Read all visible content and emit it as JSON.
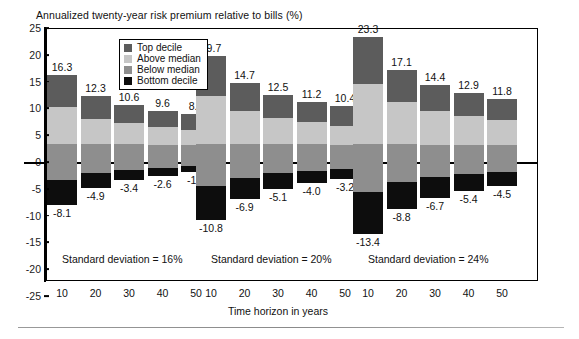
{
  "chart_data": {
    "type": "bar",
    "title": "Annualized twenty-year risk premium relative to bills (%)",
    "xlabel": "Time horizon in years",
    "ylabel": "",
    "ylim": [
      -25,
      25
    ],
    "yticks": [
      25,
      20,
      15,
      10,
      5,
      0,
      -5,
      -10,
      -15,
      -20,
      -25
    ],
    "ytick_labels": [
      "25",
      "20",
      "15",
      "10",
      "5",
      "0",
      "-5",
      "-10",
      "-15",
      "-20",
      "-25"
    ],
    "grid": false,
    "stacked": true,
    "legend_position": "inside-top-center",
    "legend": [
      {
        "name": "Top decile",
        "color": "#5c5c5c"
      },
      {
        "name": "Above median",
        "color": "#c6c6c6"
      },
      {
        "name": "Below median",
        "color": "#8e8e8e"
      },
      {
        "name": "Bottom decile",
        "color": "#0d0d0d"
      }
    ],
    "series": [
      {
        "name": "Top decile",
        "color": "#5c5c5c",
        "values": [
          16.3,
          12.3,
          10.6,
          9.6,
          8.9,
          19.7,
          14.7,
          12.5,
          11.2,
          10.4,
          23.3,
          17.1,
          14.4,
          12.9,
          11.8
        ]
      },
      {
        "name": "Above median",
        "color": "#c6c6c6",
        "values": [
          10.2,
          8.0,
          7.3,
          6.5,
          5.9,
          12.4,
          9.6,
          8.3,
          7.5,
          6.8,
          14.6,
          11.2,
          9.5,
          8.5,
          7.8
        ]
      },
      {
        "name": "Below median",
        "color": "#8e8e8e",
        "values": [
          3.4,
          3.3,
          3.3,
          3.2,
          3.2,
          3.4,
          3.4,
          3.3,
          3.3,
          3.2,
          3.3,
          3.3,
          3.2,
          3.2,
          3.2
        ]
      },
      {
        "name": "Bottom decile",
        "color": "#0d0d0d",
        "values": [
          -8.1,
          -4.9,
          -3.4,
          -2.6,
          -1.9,
          -10.8,
          -6.9,
          -5.1,
          -4.0,
          -3.2,
          -13.4,
          -8.8,
          -6.7,
          -5.4,
          -4.5
        ]
      }
    ],
    "groups": [
      {
        "note": "Standard deviation = 16%",
        "categories": [
          "10",
          "20",
          "30",
          "40",
          "50"
        ],
        "top_labels": [
          "16.3",
          "12.3",
          "10.6",
          "9.6",
          "8.9"
        ],
        "bottom_labels": [
          "-8.1",
          "-4.9",
          "-3.4",
          "-2.6",
          "-1.9"
        ]
      },
      {
        "note": "Standard deviation = 20%",
        "categories": [
          "10",
          "20",
          "30",
          "40",
          "50"
        ],
        "top_labels": [
          "19.7",
          "14.7",
          "12.5",
          "11.2",
          "10.4"
        ],
        "bottom_labels": [
          "-10.8",
          "-6.9",
          "-5.1",
          "-4.0",
          "-3.2"
        ]
      },
      {
        "note": "Standard deviation = 24%",
        "categories": [
          "10",
          "20",
          "30",
          "40",
          "50"
        ],
        "top_labels": [
          "23.3",
          "17.1",
          "14.4",
          "12.9",
          "11.8"
        ],
        "bottom_labels": [
          "-13.4",
          "-8.8",
          "-6.7",
          "-5.4",
          "-4.5"
        ]
      }
    ]
  },
  "colors": {
    "top_decile": "#5c5c5c",
    "above_median": "#c6c6c6",
    "below_median": "#8e8e8e",
    "bottom_decile": "#0d0d0d",
    "axis": "#000000",
    "background": "#ffffff"
  }
}
